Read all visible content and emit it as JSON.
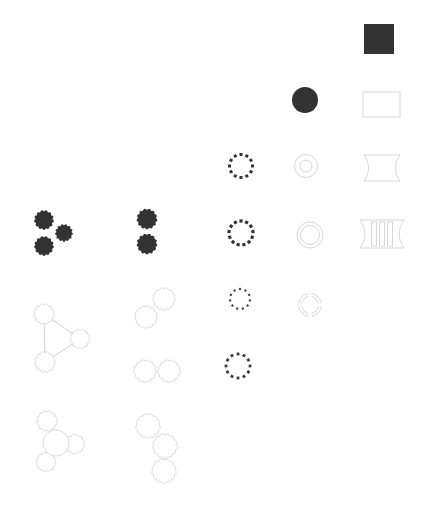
{
  "figure": {
    "width": 444,
    "height": 524,
    "background": "#ffffff"
  },
  "palette": {
    "dark": "#333333",
    "light": "#d6d6d6",
    "line": "#c9c9c9",
    "white": "#ffffff"
  },
  "glyphs": [
    {
      "name": "solid-square-glyph",
      "type": "rect",
      "params": {
        "x": 364,
        "y": 24,
        "w": 30,
        "h": 30,
        "mode": "fill",
        "color": "dark"
      }
    },
    {
      "name": "solid-circle-glyph",
      "type": "circle",
      "params": {
        "cx": 305,
        "cy": 100,
        "r": 13,
        "mode": "fill",
        "color": "dark"
      }
    },
    {
      "name": "outline-rect-glyph",
      "type": "rect",
      "params": {
        "x": 363,
        "y": 92,
        "w": 37,
        "h": 25,
        "mode": "outline",
        "color": "light"
      }
    },
    {
      "name": "dotted-ring-glyph-1",
      "type": "ring-dotted",
      "params": {
        "cx": 241,
        "cy": 166,
        "r": 11.5,
        "count": 12,
        "dot": 3,
        "color": "#333333"
      }
    },
    {
      "name": "concentric-circles-glyph",
      "type": "rings",
      "params": {
        "cx": 306,
        "cy": 166,
        "radii": [
          11.5,
          6
        ],
        "color": "light"
      }
    },
    {
      "name": "spool-glyph",
      "type": "spool",
      "params": {
        "x1": 364,
        "y1": 155,
        "x2": 400,
        "y2": 181,
        "curve": 6,
        "color": "light"
      }
    },
    {
      "name": "dark-gear-trio-glyph",
      "type": "gears",
      "params": {
        "mode": "fill",
        "color": "dark",
        "teeth": 13,
        "depth": 2,
        "items": [
          {
            "cx": 44,
            "cy": 220,
            "r": 10.5
          },
          {
            "cx": 64,
            "cy": 233,
            "r": 9.5
          },
          {
            "cx": 44,
            "cy": 246,
            "r": 10.5
          }
        ]
      }
    },
    {
      "name": "dark-gear-pair-glyph",
      "type": "gears",
      "params": {
        "mode": "fill",
        "color": "dark",
        "teeth": 13,
        "depth": 2,
        "items": [
          {
            "cx": 147,
            "cy": 219,
            "r": 11
          },
          {
            "cx": 147,
            "cy": 244,
            "r": 11
          }
        ]
      }
    },
    {
      "name": "dotted-ring-glyph-2",
      "type": "ring-dotted",
      "params": {
        "cx": 241,
        "cy": 233,
        "r": 12,
        "count": 13,
        "dot": 3.2,
        "color": "#333333"
      }
    },
    {
      "name": "double-ring-glyph",
      "type": "rings",
      "params": {
        "cx": 310,
        "cy": 235,
        "radii": [
          13,
          9.5
        ],
        "color": "light"
      }
    },
    {
      "name": "ribbed-spool-glyph",
      "type": "spool",
      "params": {
        "x1": 360,
        "y1": 220,
        "x2": 404,
        "y2": 248,
        "curve": 6.5,
        "color": "light",
        "bars": {
          "xs": [
            371.5,
            379.5,
            387.5
          ],
          "w": 5,
          "y1": 222,
          "y2": 246
        }
      }
    },
    {
      "name": "gear-network-glyph",
      "type": "gears",
      "params": {
        "mode": "outline",
        "color": "light",
        "teeth": 12,
        "depth": 2,
        "links": [
          [
            0,
            1
          ],
          [
            0,
            2
          ],
          [
            1,
            2
          ]
        ],
        "items": [
          {
            "cx": 44,
            "cy": 314,
            "r": 11
          },
          {
            "cx": 80,
            "cy": 339,
            "r": 10.5
          },
          {
            "cx": 45,
            "cy": 362,
            "r": 11
          }
        ]
      }
    },
    {
      "name": "outline-gear-pair-diagonal-glyph",
      "type": "gears",
      "params": {
        "mode": "outline",
        "color": "light",
        "teeth": 13,
        "depth": 2,
        "items": [
          {
            "cx": 164,
            "cy": 299,
            "r": 12
          },
          {
            "cx": 146,
            "cy": 317,
            "r": 12
          }
        ]
      }
    },
    {
      "name": "dotted-ring-glyph-3",
      "type": "ring-dotted",
      "params": {
        "cx": 240,
        "cy": 299,
        "r": 10,
        "count": 11,
        "dot": 2.2,
        "color": "#464646"
      }
    },
    {
      "name": "segmented-ring-glyph",
      "type": "ring-segmented",
      "params": {
        "cx": 310,
        "cy": 305,
        "outer": 11.5,
        "inner": 8.5,
        "gaps": 4,
        "color": "light"
      }
    },
    {
      "name": "outline-gear-pair-horizontal-glyph",
      "type": "gears",
      "params": {
        "mode": "outline",
        "color": "light",
        "teeth": 13,
        "depth": 2,
        "items": [
          {
            "cx": 145,
            "cy": 371,
            "r": 12
          },
          {
            "cx": 169,
            "cy": 371,
            "r": 12
          }
        ]
      }
    },
    {
      "name": "dotted-ring-glyph-4",
      "type": "ring-dotted",
      "params": {
        "cx": 238,
        "cy": 366,
        "r": 12,
        "count": 12,
        "dot": 2.8,
        "color": "#3a3a3a"
      }
    },
    {
      "name": "outline-gear-cluster-glyph",
      "type": "gears",
      "params": {
        "mode": "outline",
        "color": "light",
        "teeth": 12,
        "depth": 2,
        "items": [
          {
            "cx": 47,
            "cy": 421,
            "r": 11
          },
          {
            "cx": 75,
            "cy": 444,
            "r": 10.5
          },
          {
            "cx": 46,
            "cy": 462,
            "r": 10.5
          },
          {
            "cx": 56,
            "cy": 443,
            "r": 13,
            "shape": "circle"
          }
        ]
      }
    },
    {
      "name": "outline-gear-chain-glyph",
      "type": "gears",
      "params": {
        "mode": "outline",
        "color": "light",
        "teeth": 13,
        "depth": 2,
        "items": [
          {
            "cx": 148,
            "cy": 426,
            "r": 13
          },
          {
            "cx": 165,
            "cy": 446,
            "r": 13
          },
          {
            "cx": 164,
            "cy": 471,
            "r": 13
          }
        ]
      }
    }
  ]
}
